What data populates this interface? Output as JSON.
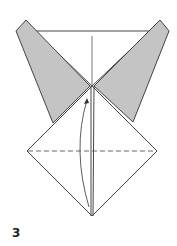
{
  "diagram": {
    "step_number": "3",
    "colors": {
      "flap_fill": "#c4c4c4",
      "stroke": "#444444",
      "paper": "#ffffff"
    },
    "elements": [
      {
        "name": "left-flap",
        "type": "shaded-polygon"
      },
      {
        "name": "right-flap",
        "type": "shaded-polygon"
      },
      {
        "name": "top-triangle",
        "type": "white-polygon"
      },
      {
        "name": "diamond-base",
        "type": "white-polygon"
      },
      {
        "name": "horizontal-valley-fold",
        "type": "dashed-line"
      },
      {
        "name": "center-crease",
        "type": "line"
      },
      {
        "name": "fold-arrow",
        "type": "curved-arrow"
      }
    ]
  }
}
